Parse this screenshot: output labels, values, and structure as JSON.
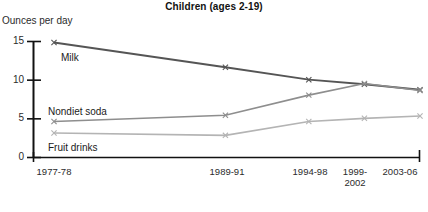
{
  "chart_data": {
    "type": "line",
    "title": "Children (ages 2-19)",
    "subtitle": "",
    "xlabel": "",
    "ylabel": "Ounces per day",
    "ylim": [
      0,
      15
    ],
    "yticks": [
      0,
      5,
      10,
      15
    ],
    "ytick_labels": [
      "0",
      "5",
      "10",
      "15"
    ],
    "grid": false,
    "legend_position": "inline-labels",
    "categories": [
      "1977-78",
      "1989-91",
      "1994-98",
      "1999-2002",
      "2003-06"
    ],
    "x_positions": [
      0,
      1.85,
      2.75,
      3.35,
      3.95
    ],
    "series": [
      {
        "name": "Milk",
        "color": "#555555",
        "values": [
          14.8,
          11.6,
          10.0,
          9.4,
          8.7
        ]
      },
      {
        "name": "Nondiet soda",
        "color": "#8e8e8e",
        "values": [
          4.6,
          5.4,
          8.0,
          9.5,
          8.6
        ]
      },
      {
        "name": "Fruit drinks",
        "color": "#b4b4b4",
        "values": [
          3.1,
          2.8,
          4.6,
          5.0,
          5.3
        ]
      }
    ],
    "annotations": [
      {
        "text": "Milk",
        "x": 61,
        "y": 59
      },
      {
        "text": "Nondiet soda",
        "x": 48,
        "y": 113
      },
      {
        "text": "Fruit drinks",
        "x": 48,
        "y": 149
      }
    ],
    "axis": {
      "x_start_px": 33,
      "x_end_px": 420,
      "y_zero_px": 157,
      "y_top_px": 41
    }
  },
  "xtick_labels": [
    {
      "label": "1977-78",
      "x": 54,
      "line2": ""
    },
    {
      "label": "1989-91",
      "x": 227,
      "line2": ""
    },
    {
      "label": "1994-98",
      "x": 310,
      "line2": ""
    },
    {
      "label": "1999-",
      "x": 355,
      "line2": "2002"
    },
    {
      "label": "2003-06",
      "x": 400,
      "line2": ""
    }
  ]
}
